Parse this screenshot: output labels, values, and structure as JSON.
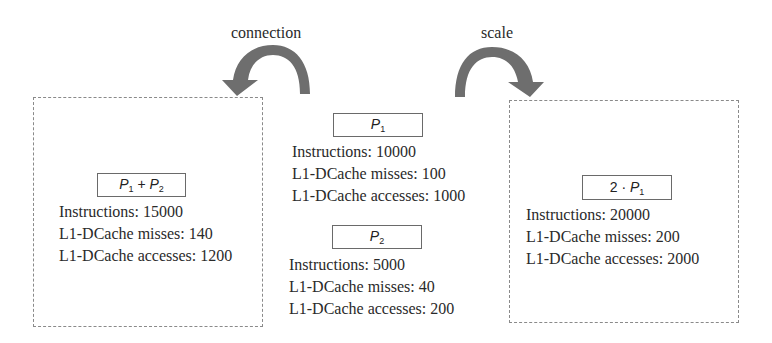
{
  "operations": {
    "connection": {
      "label": "connection"
    },
    "scale": {
      "label": "scale"
    }
  },
  "arrow_color": "#6e6e6e",
  "programs": {
    "combined": {
      "title_var1": "P",
      "title_sub1": "1",
      "title_op": " + ",
      "title_var2": "P",
      "title_sub2": "2",
      "instructions": "Instructions: 15000",
      "misses": "L1-DCache misses: 140",
      "accesses": "L1-DCache accesses: 1200"
    },
    "p1": {
      "title_var": "P",
      "title_sub": "1",
      "instructions": "Instructions: 10000",
      "misses": "L1-DCache misses: 100",
      "accesses": "L1-DCache accesses: 1000"
    },
    "p2": {
      "title_var": "P",
      "title_sub": "2",
      "instructions": "Instructions: 5000",
      "misses": "L1-DCache misses: 40",
      "accesses": "L1-DCache accesses: 200"
    },
    "scaled": {
      "title_coef": "2 · ",
      "title_var": "P",
      "title_sub": "1",
      "instructions": "Instructions: 20000",
      "misses": "L1-DCache misses: 200",
      "accesses": "L1-DCache accesses: 2000"
    }
  }
}
